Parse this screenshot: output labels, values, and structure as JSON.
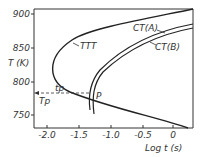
{
  "diagram": {
    "y_axis": {
      "label": "T (K)",
      "ticks": [
        "900",
        "850",
        "800",
        "750"
      ]
    },
    "x_axis": {
      "label": "Log t (s)",
      "ticks": [
        "-2.0",
        "-1.5",
        "-1.0",
        "-0.5",
        "0"
      ]
    },
    "curves": {
      "ttt": "TTT",
      "ct_a": "CT(A)",
      "ct_b": "CT(B)"
    },
    "point": "P",
    "tp_label": "tp",
    "Tp_label": "Tp"
  }
}
